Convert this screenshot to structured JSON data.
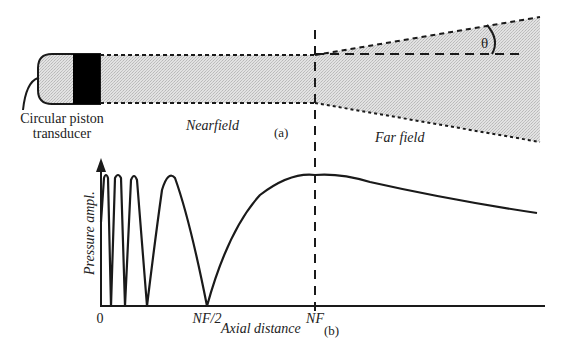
{
  "panel_a": {
    "label": "(a)",
    "transducer_label_line1": "Circular piston",
    "transducer_label_line2": "transducer",
    "nearfield_label": "Nearfield",
    "farfield_label": "Far field",
    "angle_symbol": "θ"
  },
  "panel_b": {
    "label": "(b)",
    "y_axis_label": "Pressure ampl.",
    "x_axis_label": "Axial distance",
    "x_ticks": [
      "0",
      "NF/2",
      "NF"
    ]
  },
  "colors": {
    "ink": "#1a1a1a",
    "beam_fill": "#d9d9d9",
    "transducer_body": "#cfcfcf",
    "transducer_face": "#000000"
  }
}
